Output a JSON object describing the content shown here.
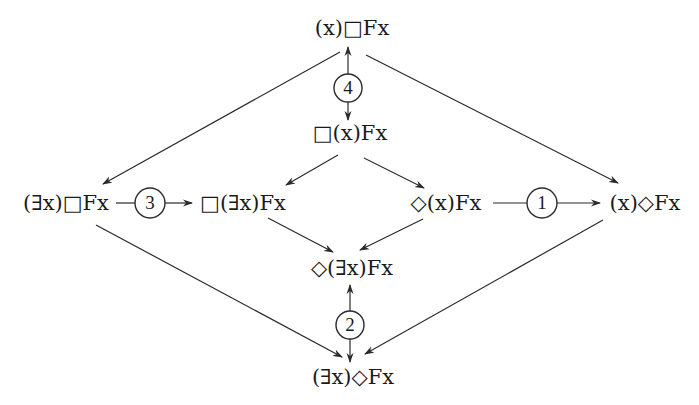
{
  "diagram": {
    "type": "modal-quantifier-implication-lattice",
    "nodes": {
      "top": {
        "label": "(x)□Fx",
        "x": 352,
        "y": 28
      },
      "box_forall": {
        "label": "□(x)Fx",
        "x": 350,
        "y": 133
      },
      "exists_box": {
        "label": "(∃x)□Fx",
        "x": 66,
        "y": 203
      },
      "box_exists": {
        "label": "□(∃x)Fx",
        "x": 243,
        "y": 203
      },
      "dia_forall": {
        "label": "◇(x)Fx",
        "x": 446,
        "y": 203
      },
      "forall_dia": {
        "label": "(x)◇Fx",
        "x": 645,
        "y": 203
      },
      "dia_exists": {
        "label": "◇(∃x)Fx",
        "x": 352,
        "y": 268
      },
      "bottom": {
        "label": "(∃x)◇Fx",
        "x": 353,
        "y": 377
      }
    },
    "markers": [
      {
        "id": "4",
        "label": "4",
        "x": 348,
        "y": 88
      },
      {
        "id": "3",
        "label": "3",
        "x": 150,
        "y": 203
      },
      {
        "id": "1",
        "label": "1",
        "x": 542,
        "y": 203
      },
      {
        "id": "2",
        "label": "2",
        "x": 350,
        "y": 325
      }
    ],
    "edges": [
      {
        "from": "top",
        "to": "exists_box"
      },
      {
        "from": "top",
        "to": "forall_dia"
      },
      {
        "from": "marker-4",
        "to": "top"
      },
      {
        "from": "marker-4",
        "to": "box_forall"
      },
      {
        "from": "box_forall",
        "to": "box_exists"
      },
      {
        "from": "box_forall",
        "to": "dia_forall"
      },
      {
        "from": "exists_box",
        "to": "box_exists",
        "via": "marker-3"
      },
      {
        "from": "dia_forall",
        "to": "forall_dia",
        "via": "marker-1"
      },
      {
        "from": "box_exists",
        "to": "dia_exists"
      },
      {
        "from": "dia_forall",
        "to": "dia_exists"
      },
      {
        "from": "exists_box",
        "to": "bottom"
      },
      {
        "from": "forall_dia",
        "to": "bottom"
      },
      {
        "from": "marker-2",
        "to": "dia_exists"
      },
      {
        "from": "marker-2",
        "to": "bottom"
      }
    ]
  }
}
